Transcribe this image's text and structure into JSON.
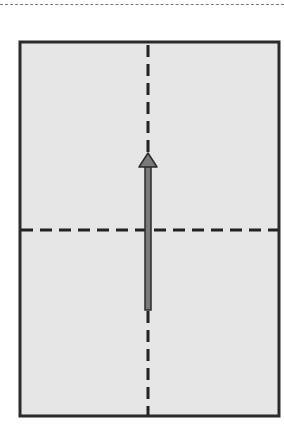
{
  "diagram": {
    "type": "page-fold-diagram",
    "colors": {
      "paper_fill": "#e6e6e6",
      "frame_stroke": "#2b2b2b",
      "fold_line": "#222222",
      "arrow_fill": "#7a7a7a",
      "arrow_stroke": "#2b2b2b",
      "top_rule": "#7a7a7a"
    },
    "frame": {
      "x": 19,
      "y": 41,
      "width": 261,
      "height": 376
    },
    "fold_lines": [
      {
        "orientation": "vertical",
        "position": 148,
        "style": "dashed"
      },
      {
        "orientation": "horizontal",
        "position": 230,
        "style": "dashed"
      }
    ],
    "arrow": {
      "direction": "up",
      "x": 148,
      "tail_y": 310,
      "tip_y": 153
    }
  }
}
